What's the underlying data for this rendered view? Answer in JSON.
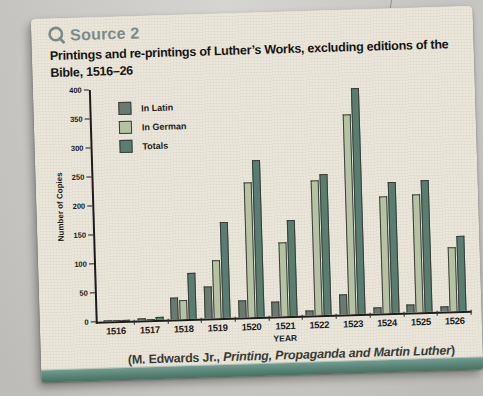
{
  "source_label": "Source 2",
  "title_lines": [
    "Printings and re-printings of Luther’s Works, excluding editions of the",
    "Bible, 1516–26"
  ],
  "citation": {
    "prefix": "(M. Edwards Jr., ",
    "book": "Printing, Propaganda and Martin Luther",
    "suffix": ")"
  },
  "colors": {
    "header_teal": "#7b8a86",
    "band_teal": "#578476",
    "paper": "#eae6da",
    "latin_bar": "#697a70",
    "german_bar": "#b5c2a3",
    "totals_bar": "#587d71"
  },
  "chart_data": {
    "type": "bar",
    "title": "Printings and re-printings of Luther’s Works, excluding editions of the Bible, 1516–26",
    "xlabel": "YEAR",
    "ylabel": "Number of Copies",
    "ylim": [
      0,
      400
    ],
    "yticks": [
      0,
      50,
      100,
      150,
      200,
      250,
      300,
      350,
      400
    ],
    "grid": false,
    "legend_position": "upper-left",
    "categories": [
      "1516",
      "1517",
      "1518",
      "1519",
      "1520",
      "1521",
      "1522",
      "1523",
      "1524",
      "1525",
      "1526"
    ],
    "series": [
      {
        "name": "In Latin",
        "color": "#697a70",
        "values": [
          1,
          3,
          38,
          55,
          30,
          25,
          8,
          35,
          10,
          13,
          8
        ]
      },
      {
        "name": "In German",
        "color": "#b5c2a3",
        "values": [
          1,
          2,
          33,
          100,
          233,
          128,
          232,
          345,
          202,
          203,
          110
        ]
      },
      {
        "name": "Totals",
        "color": "#587d71",
        "values": [
          2,
          5,
          80,
          165,
          270,
          165,
          243,
          390,
          225,
          228,
          130
        ]
      }
    ]
  }
}
